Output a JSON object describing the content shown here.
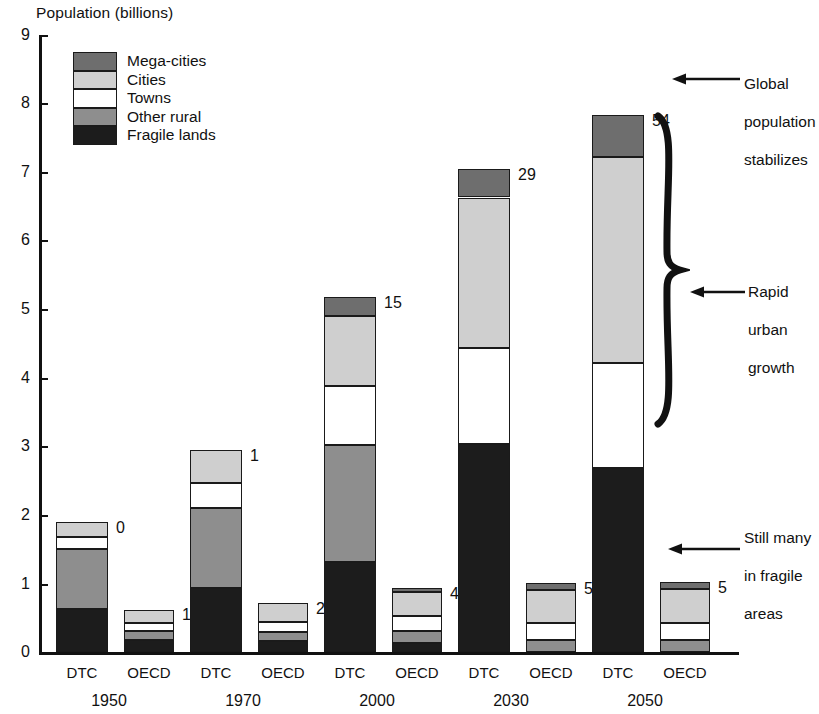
{
  "chart_data": {
    "type": "bar",
    "title": "",
    "ylabel": "Population (billions)",
    "xlabel": "",
    "ylim": [
      0,
      9
    ],
    "yticks": [
      0,
      1,
      2,
      3,
      4,
      5,
      6,
      7,
      8,
      9
    ],
    "grid": false,
    "stacked": true,
    "legend_position": "upper-left-inside",
    "categories": [
      "1950",
      "1970",
      "2000",
      "2030",
      "2050"
    ],
    "subcategories": [
      "DTC",
      "OECD"
    ],
    "series": [
      {
        "name": "Fragile lands",
        "color": "#1c1c1c",
        "values": {
          "1950": {
            "DTC": 0.63,
            "OECD": 0.17
          },
          "1970": {
            "DTC": 0.93,
            "OECD": 0.16
          },
          "2000": {
            "DTC": 1.32,
            "OECD": 0.13
          },
          "2030": {
            "DTC": 3.03,
            "OECD": 0.0
          },
          "2050": {
            "DTC": 2.68,
            "OECD": 0.0
          }
        }
      },
      {
        "name": "Other rural",
        "color": "#8e8e8e",
        "values": {
          "1950": {
            "DTC": 0.87,
            "OECD": 0.13
          },
          "1970": {
            "DTC": 1.17,
            "OECD": 0.13
          },
          "2000": {
            "DTC": 1.7,
            "OECD": 0.17
          },
          "2030": {
            "DTC": 0.0,
            "OECD": 0.17
          },
          "2050": {
            "DTC": 0.0,
            "OECD": 0.17
          }
        }
      },
      {
        "name": "Towns",
        "color": "#ffffff",
        "values": {
          "1950": {
            "DTC": 0.18,
            "OECD": 0.12
          },
          "1970": {
            "DTC": 0.37,
            "OECD": 0.15
          },
          "2000": {
            "DTC": 0.86,
            "OECD": 0.22
          },
          "2030": {
            "DTC": 1.4,
            "OECD": 0.25
          },
          "2050": {
            "DTC": 1.54,
            "OECD": 0.25
          }
        }
      },
      {
        "name": "Cities",
        "color": "#cfcfcf",
        "values": {
          "1950": {
            "DTC": 0.22,
            "OECD": 0.2
          },
          "1970": {
            "DTC": 0.48,
            "OECD": 0.27
          },
          "2000": {
            "DTC": 1.02,
            "OECD": 0.35
          },
          "2030": {
            "DTC": 2.2,
            "OECD": 0.49
          },
          "2050": {
            "DTC": 3.0,
            "OECD": 0.5
          }
        }
      },
      {
        "name": "Mega-cities",
        "color": "#6e6e6e",
        "values": {
          "1950": {
            "DTC": 0.0,
            "OECD": 0.0
          },
          "1970": {
            "DTC": 0.0,
            "OECD": 0.0
          },
          "2000": {
            "DTC": 0.28,
            "OECD": 0.07
          },
          "2030": {
            "DTC": 0.42,
            "OECD": 0.09
          },
          "2050": {
            "DTC": 0.61,
            "OECD": 0.1
          }
        }
      }
    ],
    "bar_labels": {
      "1950": {
        "DTC": "0",
        "OECD": "1"
      },
      "1970": {
        "DTC": "1",
        "OECD": "2"
      },
      "2000": {
        "DTC": "15",
        "OECD": "4"
      },
      "2030": {
        "DTC": "29",
        "OECD": "5"
      },
      "2050": {
        "DTC": "54",
        "OECD": "5"
      }
    },
    "bar_label_note": "number of mega-cities",
    "annotations": [
      {
        "id": "global-population-stabilizes",
        "text": "Global\npopulation\nstabilizes"
      },
      {
        "id": "rapid-urban-growth",
        "text": "Rapid\nurban\ngrowth"
      },
      {
        "id": "still-many-in-fragile-areas",
        "text": "Still many\nin fragile\nareas"
      }
    ]
  },
  "legend": {
    "items": [
      {
        "label": "Mega-cities",
        "color": "#6e6e6e"
      },
      {
        "label": "Cities",
        "color": "#cfcfcf"
      },
      {
        "label": "Towns",
        "color": "#ffffff"
      },
      {
        "label": "Other rural",
        "color": "#8e8e8e"
      },
      {
        "label": "Fragile lands",
        "color": "#1c1c1c"
      }
    ]
  },
  "axis": {
    "y_title": "Population (billions)",
    "y_ticks": [
      "9",
      "8",
      "7",
      "6",
      "5",
      "4",
      "3",
      "2",
      "1",
      "0"
    ]
  },
  "xaxis": {
    "groups": [
      {
        "year": "1950",
        "left": "DTC",
        "right": "OECD"
      },
      {
        "year": "1970",
        "left": "DTC",
        "right": "OECD"
      },
      {
        "year": "2000",
        "left": "DTC",
        "right": "OECD"
      },
      {
        "year": "2030",
        "left": "DTC",
        "right": "OECD"
      },
      {
        "year": "2050",
        "left": "DTC",
        "right": "OECD"
      }
    ]
  },
  "annotations": {
    "top": {
      "line1": "Global",
      "line2": "population",
      "line3": "stabilizes"
    },
    "middle": {
      "line1": "Rapid",
      "line2": "urban",
      "line3": "growth"
    },
    "bottom": {
      "line1": "Still many",
      "line2": "in fragile",
      "line3": "areas"
    }
  },
  "bar_values": {
    "g1950_dtc": "0",
    "g1950_oecd": "1",
    "g1970_dtc": "1",
    "g1970_oecd": "2",
    "g2000_dtc": "15",
    "g2000_oecd": "4",
    "g2030_dtc": "29",
    "g2030_oecd": "5",
    "g2050_dtc": "54",
    "g2050_oecd": "5"
  }
}
